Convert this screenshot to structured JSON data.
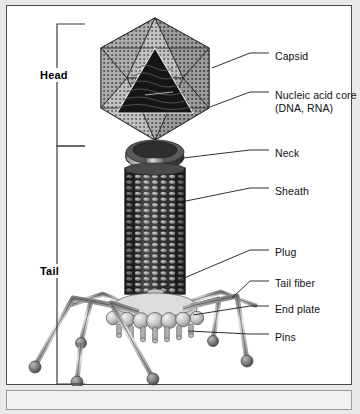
{
  "figure": {
    "type": "labeled-anatomical-diagram",
    "background_color": "#e9e9e7",
    "panel_color": "#ffffff",
    "border_color": "#4a4a4a",
    "text_color": "#111111"
  },
  "brackets": [
    {
      "id": "head",
      "label": "Head",
      "label_x": 30,
      "label_y": 62,
      "x": 50,
      "top": 18,
      "bottom": 140,
      "tick": 28
    },
    {
      "id": "tail",
      "label": "Tail",
      "label_x": 30,
      "label_y": 258,
      "x": 50,
      "top": 140,
      "bottom": 378,
      "tick": 28
    }
  ],
  "callouts": [
    {
      "id": "capsid",
      "label": "Capsid",
      "text_x": 268,
      "text_y": 44,
      "leader": [
        [
          205,
          62
        ],
        [
          243,
          47
        ],
        [
          262,
          47
        ]
      ]
    },
    {
      "id": "nucleic-acid-core",
      "label": "Nucleic acid core",
      "label_line2": "(DNA, RNA)",
      "text_x": 268,
      "text_y": 83,
      "leader": [
        [
          203,
          101
        ],
        [
          243,
          86
        ],
        [
          262,
          86
        ]
      ]
    },
    {
      "id": "neck",
      "label": "Neck",
      "text_x": 268,
      "text_y": 141,
      "leader": [
        [
          176,
          152
        ],
        [
          243,
          144
        ],
        [
          262,
          144
        ]
      ]
    },
    {
      "id": "sheath",
      "label": "Sheath",
      "text_x": 268,
      "text_y": 179,
      "leader": [
        [
          174,
          196
        ],
        [
          243,
          182
        ],
        [
          262,
          182
        ]
      ]
    },
    {
      "id": "plug",
      "label": "Plug",
      "text_x": 268,
      "text_y": 240,
      "leader": [
        [
          156,
          281
        ],
        [
          243,
          244
        ],
        [
          262,
          244
        ]
      ]
    },
    {
      "id": "tail-fiber",
      "label": "Tail fiber",
      "text_x": 268,
      "text_y": 271,
      "leader": [
        [
          225,
          292
        ],
        [
          243,
          275
        ],
        [
          262,
          275
        ]
      ]
    },
    {
      "id": "end-plate",
      "label": "End plate",
      "text_x": 268,
      "text_y": 297,
      "leader": [
        [
          186,
          309
        ],
        [
          243,
          300
        ],
        [
          262,
          300
        ]
      ]
    },
    {
      "id": "pins",
      "label": "Pins",
      "text_x": 268,
      "text_y": 325,
      "leader": [
        [
          181,
          325
        ],
        [
          243,
          328
        ],
        [
          262,
          328
        ]
      ]
    }
  ],
  "structure": {
    "capsid": {
      "name": "icosahedral capsid",
      "center_x": 148,
      "center_y": 72,
      "radius": 62,
      "fill": "#b9b9b9",
      "stroke": "#2b2b2b",
      "texture": "stippled-dots"
    },
    "core": {
      "name": "nucleic acid core",
      "fill": "#1d1d1d",
      "texture": "coiled-dna-waves"
    },
    "neck": {
      "name": "neck collar",
      "cx": 148,
      "cy": 150,
      "rx": 28,
      "ry": 12,
      "fill": "#3a3a3a"
    },
    "sheath": {
      "name": "contractile sheath",
      "x": 118,
      "y": 162,
      "width": 60,
      "height": 125,
      "columns": 7,
      "rows": 22,
      "fill": "#3c3c3c",
      "subunit_fill": "#8e8e8e"
    },
    "tail_tube": {
      "name": "central tail tube / plug",
      "x": 140,
      "y": 160,
      "width": 16,
      "height": 150,
      "fill": "#9a9a9a"
    },
    "end_plate": {
      "name": "end plate",
      "cx": 148,
      "cy": 310,
      "rx": 42,
      "ry": 14,
      "sphere_count": 7,
      "fill": "#cfcfcf"
    },
    "pins": {
      "name": "pins",
      "count": 7,
      "fill": "#b0b0b0"
    },
    "tail_fibers": {
      "name": "tail fibers",
      "count": 6,
      "fill": "#a8a8a8",
      "foot_fill": "#6f6f6f"
    }
  }
}
